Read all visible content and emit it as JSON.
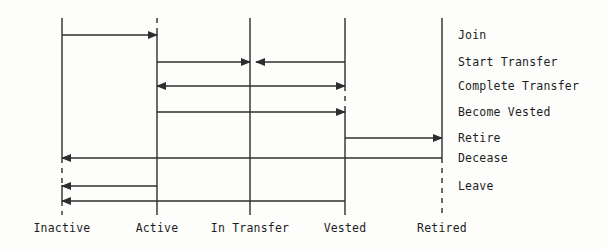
{
  "diagram": {
    "type": "state-transition-sequence",
    "title": "",
    "canvas": {
      "width": 607,
      "height": 250
    },
    "colors": {
      "background": "#fdfdfc",
      "line": "#2e2e2e",
      "lifeline": "#3a3a3a",
      "text": "#1d1d1d"
    },
    "states": [
      {
        "id": "inactive",
        "label": "Inactive",
        "x": 62,
        "label_y": 232,
        "top": 18,
        "bottom": 215
      },
      {
        "id": "active",
        "label": "Active",
        "x": 157,
        "label_y": 232,
        "top": 18,
        "bottom": 215
      },
      {
        "id": "in_transfer",
        "label": "In Transfer",
        "x": 250,
        "label_y": 232,
        "top": 18,
        "bottom": 215
      },
      {
        "id": "vested",
        "label": "Vested",
        "x": 345,
        "label_y": 232,
        "top": 18,
        "bottom": 215
      },
      {
        "id": "retired",
        "label": "Retired",
        "x": 442,
        "label_y": 232,
        "top": 18,
        "bottom": 215
      }
    ],
    "lifeline_dashes": [
      {
        "state": "active",
        "from_y": 18,
        "to_y": 33
      },
      {
        "state": "vested",
        "from_y": 86,
        "to_y": 111
      },
      {
        "state": "inactive",
        "from_y": 158,
        "to_y": 185
      },
      {
        "state": "inactive",
        "from_y": 201,
        "to_y": 215
      },
      {
        "state": "retired",
        "from_y": 158,
        "to_y": 215
      }
    ],
    "events": [
      {
        "id": "join",
        "label": "Join",
        "y": 35,
        "label_x": 458,
        "label_y": 39,
        "arrows": [
          {
            "from": "inactive",
            "to": "active",
            "direction": "right",
            "from_x": 62,
            "to_x": 157
          }
        ]
      },
      {
        "id": "start_transfer",
        "label": "Start Transfer",
        "y": 62,
        "label_x": 458,
        "label_y": 66,
        "arrows": [
          {
            "from": "active",
            "to": "in_transfer",
            "direction": "right",
            "from_x": 157,
            "to_x": 250
          },
          {
            "from": "vested",
            "to": "in_transfer",
            "direction": "left",
            "from_x": 345,
            "to_x": 256
          }
        ]
      },
      {
        "id": "complete_transfer",
        "label": "Complete Transfer",
        "y": 86,
        "label_x": 458,
        "label_y": 90,
        "arrows": [
          {
            "from": "in_transfer",
            "to": "active",
            "direction": "both",
            "from_x": 157,
            "to_x": 345
          }
        ]
      },
      {
        "id": "become_vested",
        "label": "Become Vested",
        "y": 112,
        "label_x": 458,
        "label_y": 116,
        "arrows": [
          {
            "from": "active",
            "to": "vested",
            "direction": "right",
            "from_x": 157,
            "to_x": 345
          }
        ]
      },
      {
        "id": "retire",
        "label": "Retire",
        "y": 138,
        "label_x": 458,
        "label_y": 142,
        "arrows": [
          {
            "from": "vested",
            "to": "retired",
            "direction": "right",
            "from_x": 345,
            "to_x": 442
          }
        ]
      },
      {
        "id": "decease",
        "label": "Decease",
        "y": 158,
        "label_x": 458,
        "label_y": 162,
        "arrows": [
          {
            "from": "retired",
            "to": "inactive",
            "direction": "left",
            "from_x": 442,
            "to_x": 62
          }
        ]
      },
      {
        "id": "leave",
        "label": "Leave",
        "y": 186,
        "label_x": 458,
        "label_y": 190,
        "arrows": [
          {
            "from": "active",
            "to": "inactive",
            "direction": "left",
            "from_x": 157,
            "to_x": 62
          },
          {
            "from": "vested",
            "to": "inactive",
            "direction": "left",
            "from_x": 345,
            "to_x": 62,
            "y": 201
          }
        ]
      }
    ]
  }
}
